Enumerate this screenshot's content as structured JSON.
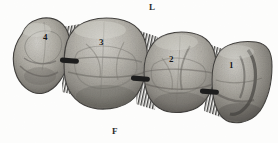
{
  "figure": {
    "type": "anatomical-photograph",
    "rendering": "grayscale halftone photograph",
    "background_color": "#fdfdfc",
    "orientation_labels": [
      {
        "name": "lingual",
        "text": "L",
        "position": "top-center"
      },
      {
        "name": "facial",
        "text": "F",
        "position": "bottom-left-of-center"
      }
    ],
    "teeth": [
      {
        "number": "4",
        "label": "4",
        "position": "leftmost",
        "shape": "oval-teardrop",
        "size": "small"
      },
      {
        "number": "3",
        "label": "3",
        "position": "second-from-left",
        "shape": "rounded-square",
        "size": "largest"
      },
      {
        "number": "2",
        "label": "2",
        "position": "third-from-left",
        "shape": "rounded-square",
        "size": "medium"
      },
      {
        "number": "1",
        "label": "1",
        "position": "rightmost",
        "shape": "rounded-rectangle-cropped",
        "size": "medium"
      }
    ],
    "contact_markers": [
      {
        "name": "contact-point-4-3",
        "between": "4 and 3"
      },
      {
        "name": "contact-point-3-2",
        "between": "3 and 2"
      },
      {
        "name": "contact-point-2-1",
        "between": "2 and 1"
      }
    ],
    "interproximal_hatching": [
      {
        "name": "hatch-4-3",
        "between": "4 and 3"
      },
      {
        "name": "hatch-3-2",
        "between": "3 and 2"
      },
      {
        "name": "hatch-2-1",
        "between": "2 and 1"
      }
    ],
    "colors": {
      "tooth_light": "#c8c6c0",
      "tooth_mid": "#a3a09a",
      "tooth_dark": "#6f6c67",
      "tooth_shadow": "#3d3b38",
      "marker_black": "#111111",
      "text": "#1d1d1d"
    }
  }
}
